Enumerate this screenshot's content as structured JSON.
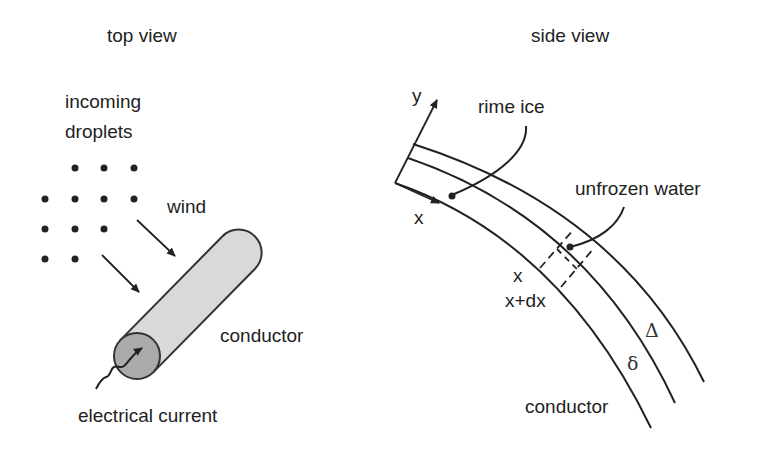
{
  "top_view": {
    "title": "top view",
    "droplets_label_line1": "incoming",
    "droplets_label_line2": "droplets",
    "wind_label": "wind",
    "conductor_label": "conductor",
    "current_label": "electrical current"
  },
  "side_view": {
    "title": "side view",
    "axis_y_label": "y",
    "axis_x_label": "x",
    "rime_ice_label": "rime ice",
    "unfrozen_water_label": "unfrozen water",
    "x_label": "x",
    "x_dx_label": "x+dx",
    "delta_upper_label": "Δ",
    "delta_lower_label": "δ",
    "conductor_label": "conductor"
  },
  "colors": {
    "line": "#222222",
    "conductor_body": "#d9d9d9",
    "conductor_end": "#aaaaaa"
  }
}
